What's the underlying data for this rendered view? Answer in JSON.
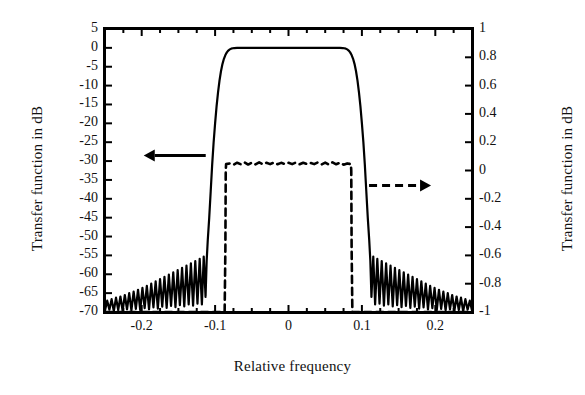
{
  "chart_data": {
    "type": "line",
    "title": "",
    "xlabel": "Relative frequency",
    "ylabel_left": "Transfer function in dB",
    "ylabel_right": "Transfer function in dB",
    "xlim": [
      -0.25,
      0.25
    ],
    "ylim_left": [
      -70,
      5
    ],
    "ylim_right": [
      -1,
      1
    ],
    "grid": false,
    "legend": "none",
    "xticks": [
      -0.2,
      -0.1,
      0,
      0.1,
      0.2
    ],
    "xtick_labels": [
      "-0.2",
      "-0.1",
      "0",
      "0.1",
      "0.2"
    ],
    "yticks_left": [
      5,
      0,
      -5,
      -10,
      -15,
      -20,
      -25,
      -30,
      -35,
      -40,
      -45,
      -50,
      -55,
      -60,
      -65,
      -70
    ],
    "ytick_labels_left": [
      "5",
      "0",
      "-5",
      "-10",
      "-15",
      "-20",
      "-25",
      "-30",
      "-35",
      "-40",
      "-45",
      "-50",
      "-55",
      "-60",
      "-65",
      "-70"
    ],
    "yticks_right": [
      1,
      0.8,
      0.6,
      0.4,
      0.2,
      0,
      -0.2,
      -0.4,
      -0.6,
      -0.8,
      -1
    ],
    "ytick_labels_right": [
      "1",
      "0.8",
      "0.6",
      "0.4",
      "0.2",
      "0",
      "-0.2",
      "-0.4",
      "-0.6",
      "-0.8",
      "-1"
    ],
    "annotations": [
      {
        "name": "left-axis-arrow",
        "style": "solid",
        "direction": "left",
        "x_data": -0.155,
        "y_data_left": -28.5
      },
      {
        "name": "right-axis-arrow",
        "style": "dashed",
        "direction": "right",
        "x_data": 0.152,
        "y_data_left": -36.5
      }
    ],
    "series": [
      {
        "name": "magnitude-response-dB",
        "axis": "left",
        "style": "solid",
        "color": "#000000",
        "description": "Lowpass filter magnitude response in dB with 0 dB passband from -0.09 to 0.09 and decaying stopband ripples",
        "points": [
          [
            -0.25,
            -69.6
          ],
          [
            -0.247,
            -67.0
          ],
          [
            -0.244,
            -69.4
          ],
          [
            -0.241,
            -66.6
          ],
          [
            -0.238,
            -69.8
          ],
          [
            -0.235,
            -66.2
          ],
          [
            -0.232,
            -69.5
          ],
          [
            -0.229,
            -65.9
          ],
          [
            -0.226,
            -69.7
          ],
          [
            -0.223,
            -65.5
          ],
          [
            -0.22,
            -69.3
          ],
          [
            -0.217,
            -65.0
          ],
          [
            -0.214,
            -69.6
          ],
          [
            -0.211,
            -64.6
          ],
          [
            -0.208,
            -69.2
          ],
          [
            -0.205,
            -64.1
          ],
          [
            -0.202,
            -69.5
          ],
          [
            -0.199,
            -63.6
          ],
          [
            -0.196,
            -69.0
          ],
          [
            -0.193,
            -63.1
          ],
          [
            -0.19,
            -69.3
          ],
          [
            -0.187,
            -62.5
          ],
          [
            -0.184,
            -68.8
          ],
          [
            -0.181,
            -61.9
          ],
          [
            -0.178,
            -69.1
          ],
          [
            -0.175,
            -61.3
          ],
          [
            -0.172,
            -68.6
          ],
          [
            -0.169,
            -60.7
          ],
          [
            -0.166,
            -68.9
          ],
          [
            -0.163,
            -60.1
          ],
          [
            -0.16,
            -68.4
          ],
          [
            -0.157,
            -59.5
          ],
          [
            -0.154,
            -68.7
          ],
          [
            -0.151,
            -58.9
          ],
          [
            -0.148,
            -68.2
          ],
          [
            -0.145,
            -58.3
          ],
          [
            -0.142,
            -68.5
          ],
          [
            -0.139,
            -57.7
          ],
          [
            -0.136,
            -68.0
          ],
          [
            -0.133,
            -57.1
          ],
          [
            -0.13,
            -68.3
          ],
          [
            -0.127,
            -56.5
          ],
          [
            -0.124,
            -67.8
          ],
          [
            -0.121,
            -55.9
          ],
          [
            -0.118,
            -68.0
          ],
          [
            -0.1155,
            -55.3
          ],
          [
            -0.113,
            -66.0
          ],
          [
            -0.1115,
            -56.5
          ],
          [
            -0.11,
            -51.0
          ],
          [
            -0.108,
            -45.0
          ],
          [
            -0.106,
            -38.0
          ],
          [
            -0.104,
            -31.0
          ],
          [
            -0.102,
            -25.0
          ],
          [
            -0.1,
            -20.0
          ],
          [
            -0.098,
            -15.5
          ],
          [
            -0.096,
            -11.8
          ],
          [
            -0.094,
            -8.7
          ],
          [
            -0.092,
            -6.2
          ],
          [
            -0.09,
            -4.3
          ],
          [
            -0.088,
            -2.9
          ],
          [
            -0.086,
            -1.9
          ],
          [
            -0.084,
            -1.2
          ],
          [
            -0.082,
            -0.7
          ],
          [
            -0.08,
            -0.4
          ],
          [
            -0.078,
            -0.2
          ],
          [
            -0.076,
            -0.1
          ],
          [
            -0.074,
            -0.05
          ],
          [
            -0.07,
            0.0
          ],
          [
            -0.06,
            0.0
          ],
          [
            -0.04,
            0.0
          ],
          [
            -0.02,
            0.0
          ],
          [
            0.0,
            0.0
          ],
          [
            0.02,
            0.0
          ],
          [
            0.04,
            0.0
          ],
          [
            0.06,
            0.0
          ],
          [
            0.07,
            0.0
          ],
          [
            0.074,
            -0.05
          ],
          [
            0.076,
            -0.1
          ],
          [
            0.078,
            -0.2
          ],
          [
            0.08,
            -0.4
          ],
          [
            0.082,
            -0.7
          ],
          [
            0.084,
            -1.2
          ],
          [
            0.086,
            -1.9
          ],
          [
            0.088,
            -2.9
          ],
          [
            0.09,
            -4.3
          ],
          [
            0.092,
            -6.2
          ],
          [
            0.094,
            -8.7
          ],
          [
            0.096,
            -11.8
          ],
          [
            0.098,
            -15.5
          ],
          [
            0.1,
            -20.0
          ],
          [
            0.102,
            -25.0
          ],
          [
            0.104,
            -31.0
          ],
          [
            0.106,
            -38.0
          ],
          [
            0.108,
            -45.0
          ],
          [
            0.11,
            -51.0
          ],
          [
            0.1115,
            -56.5
          ],
          [
            0.113,
            -66.0
          ],
          [
            0.1155,
            -55.3
          ],
          [
            0.118,
            -68.0
          ],
          [
            0.121,
            -55.9
          ],
          [
            0.124,
            -67.8
          ],
          [
            0.127,
            -56.5
          ],
          [
            0.13,
            -68.3
          ],
          [
            0.133,
            -57.1
          ],
          [
            0.136,
            -68.0
          ],
          [
            0.139,
            -57.7
          ],
          [
            0.142,
            -68.5
          ],
          [
            0.145,
            -58.3
          ],
          [
            0.148,
            -68.2
          ],
          [
            0.151,
            -58.9
          ],
          [
            0.154,
            -68.7
          ],
          [
            0.157,
            -59.5
          ],
          [
            0.16,
            -68.4
          ],
          [
            0.163,
            -60.1
          ],
          [
            0.166,
            -68.9
          ],
          [
            0.169,
            -60.7
          ],
          [
            0.172,
            -68.6
          ],
          [
            0.175,
            -61.3
          ],
          [
            0.178,
            -69.1
          ],
          [
            0.181,
            -61.9
          ],
          [
            0.184,
            -68.8
          ],
          [
            0.187,
            -62.5
          ],
          [
            0.19,
            -69.3
          ],
          [
            0.193,
            -63.1
          ],
          [
            0.196,
            -69.0
          ],
          [
            0.199,
            -63.6
          ],
          [
            0.202,
            -69.5
          ],
          [
            0.205,
            -64.1
          ],
          [
            0.208,
            -69.2
          ],
          [
            0.211,
            -64.6
          ],
          [
            0.214,
            -69.6
          ],
          [
            0.217,
            -65.0
          ],
          [
            0.22,
            -69.3
          ],
          [
            0.223,
            -65.5
          ],
          [
            0.226,
            -69.7
          ],
          [
            0.229,
            -65.9
          ],
          [
            0.232,
            -69.5
          ],
          [
            0.235,
            -66.2
          ],
          [
            0.238,
            -69.8
          ],
          [
            0.241,
            -66.6
          ],
          [
            0.244,
            -69.4
          ],
          [
            0.247,
            -67.0
          ],
          [
            0.25,
            -69.6
          ]
        ]
      },
      {
        "name": "impulse-response-linear",
        "axis": "right",
        "style": "dashed",
        "color": "#000000",
        "description": "Rectangular band response on linear right axis, level approximately 0.05 between -0.085 and 0.085, zero elsewhere",
        "points": [
          [
            -0.25,
            -1.0
          ],
          [
            -0.087,
            -1.0
          ],
          [
            -0.086,
            -0.55
          ],
          [
            -0.0855,
            0.0
          ],
          [
            -0.085,
            0.045
          ],
          [
            -0.08,
            0.05
          ],
          [
            -0.075,
            0.041
          ],
          [
            -0.07,
            0.055
          ],
          [
            -0.065,
            0.044
          ],
          [
            -0.06,
            0.058
          ],
          [
            -0.055,
            0.042
          ],
          [
            -0.05,
            0.056
          ],
          [
            -0.045,
            0.043
          ],
          [
            -0.04,
            0.057
          ],
          [
            -0.035,
            0.044
          ],
          [
            -0.03,
            0.055
          ],
          [
            -0.025,
            0.045
          ],
          [
            -0.02,
            0.056
          ],
          [
            -0.015,
            0.044
          ],
          [
            -0.01,
            0.054
          ],
          [
            -0.005,
            0.046
          ],
          [
            0.0,
            0.055
          ],
          [
            0.005,
            0.045
          ],
          [
            0.01,
            0.056
          ],
          [
            0.015,
            0.044
          ],
          [
            0.02,
            0.055
          ],
          [
            0.025,
            0.046
          ],
          [
            0.03,
            0.054
          ],
          [
            0.035,
            0.045
          ],
          [
            0.04,
            0.057
          ],
          [
            0.045,
            0.043
          ],
          [
            0.05,
            0.056
          ],
          [
            0.055,
            0.042
          ],
          [
            0.06,
            0.058
          ],
          [
            0.065,
            0.044
          ],
          [
            0.07,
            0.055
          ],
          [
            0.075,
            0.041
          ],
          [
            0.08,
            0.05
          ],
          [
            0.085,
            0.045
          ],
          [
            0.0855,
            0.0
          ],
          [
            0.086,
            -0.55
          ],
          [
            0.087,
            -1.0
          ],
          [
            0.25,
            -1.0
          ]
        ]
      }
    ]
  }
}
